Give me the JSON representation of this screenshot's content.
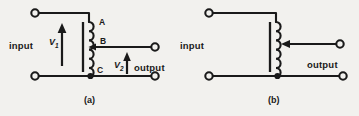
{
  "figure": {
    "kind": "circuit-diagram",
    "ink_color": "#1a1a1a",
    "background_color": "#f2f1ee",
    "panels": [
      {
        "id": "a",
        "caption": "(a)",
        "input_label": "input",
        "output_label": "output",
        "voltage_labels": [
          {
            "name": "V1",
            "base": "V",
            "sub": "1"
          },
          {
            "name": "V2",
            "base": "V",
            "sub": "2"
          }
        ],
        "node_labels": [
          {
            "name": "A",
            "text": "A"
          },
          {
            "name": "B",
            "text": "B"
          },
          {
            "name": "C",
            "text": "C"
          }
        ],
        "winding_turns": 6,
        "tap_type": "fixed"
      },
      {
        "id": "b",
        "caption": "(b)",
        "input_label": "input",
        "output_label": "output",
        "voltage_labels": [],
        "node_labels": [],
        "winding_turns": 6,
        "tap_type": "sliding-arrow"
      }
    ]
  }
}
